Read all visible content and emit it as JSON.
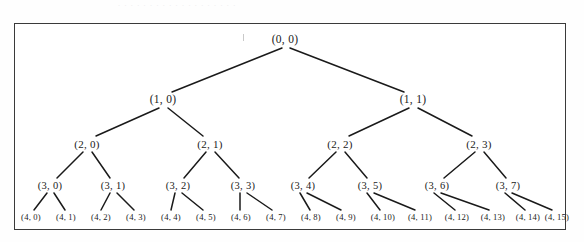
{
  "figure": {
    "kind": "complete-binary-tree",
    "caption_remnant": ". . .   . . .  . . . . .  . .  . . . . . .",
    "border_color": "#3a3a3a",
    "edge_color": "#1a1a1a",
    "background_color": "#ffffff",
    "depth_levels": 5
  },
  "tree": {
    "levels": [
      {
        "level": 0,
        "nodes": [
          {
            "label": "(0, 0)",
            "x": 285,
            "y": 40
          }
        ]
      },
      {
        "level": 1,
        "nodes": [
          {
            "label": "(1, 0)",
            "x": 163,
            "y": 100
          },
          {
            "label": "(1, 1)",
            "x": 413,
            "y": 100
          }
        ]
      },
      {
        "level": 2,
        "nodes": [
          {
            "label": "(2, 0)",
            "x": 87,
            "y": 144
          },
          {
            "label": "(2, 1)",
            "x": 210,
            "y": 144
          },
          {
            "label": "(2, 2)",
            "x": 340,
            "y": 144
          },
          {
            "label": "(2, 3)",
            "x": 479,
            "y": 144
          }
        ]
      },
      {
        "level": 3,
        "nodes": [
          {
            "label": "(3, 0)",
            "x": 50,
            "y": 186
          },
          {
            "label": "(3, 1)",
            "x": 113,
            "y": 186
          },
          {
            "label": "(3, 2)",
            "x": 178,
            "y": 186
          },
          {
            "label": "(3, 3)",
            "x": 243,
            "y": 186
          },
          {
            "label": "(3, 4)",
            "x": 303,
            "y": 186
          },
          {
            "label": "(3, 5)",
            "x": 370,
            "y": 186
          },
          {
            "label": "(3, 6)",
            "x": 437,
            "y": 186
          },
          {
            "label": "(3, 7)",
            "x": 508,
            "y": 186
          }
        ]
      },
      {
        "level": 4,
        "nodes": [
          {
            "label": "(4, 0)",
            "x": 31,
            "y": 217
          },
          {
            "label": "(4, 1)",
            "x": 66,
            "y": 217
          },
          {
            "label": "(4, 2)",
            "x": 101,
            "y": 217
          },
          {
            "label": "(4, 3)",
            "x": 136,
            "y": 217
          },
          {
            "label": "(4, 4)",
            "x": 171,
            "y": 217
          },
          {
            "label": "(4, 5)",
            "x": 206,
            "y": 217
          },
          {
            "label": "(4, 6)",
            "x": 241,
            "y": 217
          },
          {
            "label": "(4, 7)",
            "x": 276,
            "y": 217
          },
          {
            "label": "(4, 8)",
            "x": 311,
            "y": 217
          },
          {
            "label": "(4, 9)",
            "x": 346,
            "y": 217
          },
          {
            "label": "(4, 10)",
            "x": 383,
            "y": 217
          },
          {
            "label": "(4, 11)",
            "x": 420,
            "y": 217
          },
          {
            "label": "(4, 12)",
            "x": 457,
            "y": 217
          },
          {
            "label": "(4, 13)",
            "x": 493,
            "y": 217
          },
          {
            "label": "(4, 14)",
            "x": 528,
            "y": 217
          },
          {
            "label": "(4, 15)",
            "x": 557,
            "y": 217
          }
        ]
      }
    ],
    "edges": [
      {
        "from": "(0, 0)",
        "to": "(1, 0)",
        "x1": 282,
        "y1": 48,
        "x2": 172,
        "y2": 92
      },
      {
        "from": "(0, 0)",
        "to": "(1, 1)",
        "x1": 290,
        "y1": 48,
        "x2": 404,
        "y2": 92
      },
      {
        "from": "(1, 0)",
        "to": "(2, 0)",
        "x1": 159,
        "y1": 108,
        "x2": 96,
        "y2": 136
      },
      {
        "from": "(1, 0)",
        "to": "(2, 1)",
        "x1": 168,
        "y1": 108,
        "x2": 203,
        "y2": 136
      },
      {
        "from": "(1, 1)",
        "to": "(2, 2)",
        "x1": 409,
        "y1": 108,
        "x2": 349,
        "y2": 136
      },
      {
        "from": "(1, 1)",
        "to": "(2, 3)",
        "x1": 418,
        "y1": 108,
        "x2": 472,
        "y2": 136
      },
      {
        "from": "(2, 0)",
        "to": "(3, 0)",
        "x1": 83,
        "y1": 152,
        "x2": 57,
        "y2": 178
      },
      {
        "from": "(2, 0)",
        "to": "(3, 1)",
        "x1": 92,
        "y1": 152,
        "x2": 110,
        "y2": 178
      },
      {
        "from": "(2, 1)",
        "to": "(3, 2)",
        "x1": 206,
        "y1": 152,
        "x2": 184,
        "y2": 178
      },
      {
        "from": "(2, 1)",
        "to": "(3, 3)",
        "x1": 215,
        "y1": 152,
        "x2": 239,
        "y2": 178
      },
      {
        "from": "(2, 2)",
        "to": "(3, 4)",
        "x1": 336,
        "y1": 152,
        "x2": 309,
        "y2": 178
      },
      {
        "from": "(2, 2)",
        "to": "(3, 5)",
        "x1": 345,
        "y1": 152,
        "x2": 367,
        "y2": 178
      },
      {
        "from": "(2, 3)",
        "to": "(3, 6)",
        "x1": 475,
        "y1": 152,
        "x2": 444,
        "y2": 178
      },
      {
        "from": "(2, 3)",
        "to": "(3, 7)",
        "x1": 484,
        "y1": 152,
        "x2": 506,
        "y2": 178
      },
      {
        "from": "(3, 0)",
        "to": "(4, 0)",
        "x1": 47,
        "y1": 193,
        "x2": 34,
        "y2": 210
      },
      {
        "from": "(3, 0)",
        "to": "(4, 1)",
        "x1": 54,
        "y1": 193,
        "x2": 65,
        "y2": 210
      },
      {
        "from": "(3, 1)",
        "to": "(4, 2)",
        "x1": 110,
        "y1": 193,
        "x2": 101,
        "y2": 210
      },
      {
        "from": "(3, 1)",
        "to": "(4, 3)",
        "x1": 117,
        "y1": 193,
        "x2": 134,
        "y2": 210
      },
      {
        "from": "(3, 2)",
        "to": "(4, 4)",
        "x1": 175,
        "y1": 193,
        "x2": 171,
        "y2": 210
      },
      {
        "from": "(3, 2)",
        "to": "(4, 5)",
        "x1": 182,
        "y1": 193,
        "x2": 203,
        "y2": 210
      },
      {
        "from": "(3, 3)",
        "to": "(4, 6)",
        "x1": 240,
        "y1": 193,
        "x2": 240,
        "y2": 210
      },
      {
        "from": "(3, 3)",
        "to": "(4, 7)",
        "x1": 247,
        "y1": 193,
        "x2": 272,
        "y2": 210
      },
      {
        "from": "(3, 4)",
        "to": "(4, 8)",
        "x1": 300,
        "y1": 193,
        "x2": 310,
        "y2": 210
      },
      {
        "from": "(3, 4)",
        "to": "(4, 9)",
        "x1": 307,
        "y1": 193,
        "x2": 341,
        "y2": 210
      },
      {
        "from": "(3, 5)",
        "to": "(4, 10)",
        "x1": 367,
        "y1": 193,
        "x2": 380,
        "y2": 210
      },
      {
        "from": "(3, 5)",
        "to": "(4, 11)",
        "x1": 374,
        "y1": 193,
        "x2": 415,
        "y2": 210
      },
      {
        "from": "(3, 6)",
        "to": "(4, 12)",
        "x1": 434,
        "y1": 193,
        "x2": 455,
        "y2": 210
      },
      {
        "from": "(3, 6)",
        "to": "(4, 13)",
        "x1": 441,
        "y1": 193,
        "x2": 489,
        "y2": 210
      },
      {
        "from": "(3, 7)",
        "to": "(4, 14)",
        "x1": 505,
        "y1": 193,
        "x2": 525,
        "y2": 210
      },
      {
        "from": "(3, 7)",
        "to": "(4, 15)",
        "x1": 512,
        "y1": 193,
        "x2": 552,
        "y2": 210
      }
    ]
  }
}
